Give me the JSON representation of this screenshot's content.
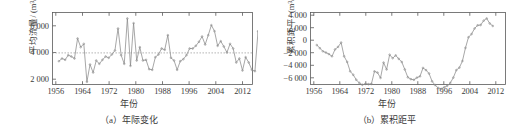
{
  "figure": {
    "panels": [
      {
        "id": "panel-a",
        "caption": "（a）年际变化",
        "xlabel": "年份",
        "ylabel": "平均流量/ (m³/s)"
      },
      {
        "id": "panel-b",
        "caption": "（b）累积距平",
        "xlabel": "年份",
        "ylabel": "累积距平/ (m³/s)"
      }
    ]
  },
  "chart_data": [
    {
      "type": "line",
      "title": "（a）年际变化",
      "xlabel": "年份",
      "ylabel": "平均流量/ (m³/s)",
      "xlim": [
        1955,
        2015
      ],
      "ylim": [
        1500,
        6900
      ],
      "xticks": [
        1956,
        1964,
        1972,
        1980,
        1988,
        1996,
        2004,
        2012
      ],
      "yticks": [
        2000,
        4000,
        6000
      ],
      "grid": false,
      "legend": null,
      "markers": "open-circle",
      "annotations": [
        {
          "type": "hline",
          "value": 3870,
          "style": "dotted",
          "label": "多年平均值"
        }
      ],
      "x": [
        1956,
        1957,
        1958,
        1959,
        1960,
        1961,
        1962,
        1963,
        1964,
        1965,
        1966,
        1967,
        1968,
        1969,
        1970,
        1971,
        1972,
        1973,
        1974,
        1975,
        1976,
        1977,
        1978,
        1979,
        1980,
        1981,
        1982,
        1983,
        1984,
        1985,
        1986,
        1987,
        1988,
        1989,
        1990,
        1991,
        1992,
        1993,
        1994,
        1995,
        1996,
        1997,
        1998,
        1999,
        2000,
        2001,
        2002,
        2003,
        2004,
        2005,
        2006,
        2007,
        2008,
        2009,
        2010,
        2011,
        2012,
        2013,
        2014
      ],
      "values": [
        3250,
        3450,
        3350,
        3700,
        3600,
        3450,
        4950,
        4300,
        4550,
        1700,
        3000,
        2400,
        3300,
        3050,
        3350,
        3600,
        3500,
        3750,
        4050,
        5700,
        3700,
        3050,
        6450,
        2900,
        6100,
        3300,
        4300,
        3300,
        3350,
        2650,
        2600,
        3550,
        3750,
        4200,
        4100,
        5200,
        3500,
        3300,
        2600,
        3250,
        3400,
        3700,
        4200,
        4200,
        4400,
        4700,
        5100,
        4500,
        5200,
        5950,
        5500,
        4400,
        4750,
        4350,
        3900,
        4550,
        4200,
        3150,
        3450
      ],
      "values_tail": [
        2550,
        3550,
        3150,
        2600,
        2500,
        5500,
        3100,
        5450,
        2900,
        3850,
        4000
      ]
    },
    {
      "type": "line",
      "title": "（b）累积距平",
      "xlabel": "年份",
      "ylabel": "累积距平/ (m³/s)",
      "xlim": [
        1955,
        2015
      ],
      "ylim": [
        -7000,
        4500
      ],
      "xticks": [
        1956,
        1964,
        1972,
        1980,
        1988,
        1996,
        2004,
        2012
      ],
      "yticks": [
        4000,
        2000,
        0,
        -2000,
        -4000,
        -6000
      ],
      "grid": false,
      "legend": null,
      "markers": "open-circle",
      "x": [
        1956,
        1957,
        1958,
        1959,
        1960,
        1961,
        1962,
        1963,
        1964,
        1965,
        1966,
        1967,
        1968,
        1969,
        1970,
        1971,
        1972,
        1973,
        1974,
        1975,
        1976,
        1977,
        1978,
        1979,
        1980,
        1981,
        1982,
        1983,
        1984,
        1985,
        1986,
        1987,
        1988,
        1989,
        1990,
        1991,
        1992,
        1993,
        1994,
        1995,
        1996,
        1997,
        1998,
        1999,
        2000,
        2001,
        2002,
        2003,
        2004,
        2005,
        2006,
        2007,
        2008,
        2009,
        2010,
        2011,
        2012,
        2013,
        2014
      ],
      "values": [
        -700,
        -1200,
        -1700,
        -1900,
        -2150,
        -2500,
        -1400,
        -1000,
        -300,
        -2500,
        -3400,
        -4900,
        -5450,
        -6250,
        -6750,
        -7050,
        -6900,
        -6950,
        -6900,
        -4900,
        -5100,
        -5950,
        -3500,
        -4600,
        -2250,
        -2800,
        -2350,
        -2900,
        -3400,
        -4600,
        -5850,
        -6150,
        -6250,
        -5900,
        -5700,
        -4350,
        -4700,
        -5250,
        -6500,
        -7100,
        -7550,
        -7700,
        -7450,
        -7200,
        -6750,
        -5900,
        -4700,
        -4300,
        -3250,
        -1150,
        550,
        1050,
        1950,
        2450,
        2500,
        3200,
        3550,
        2750,
        2350
      ]
    }
  ]
}
